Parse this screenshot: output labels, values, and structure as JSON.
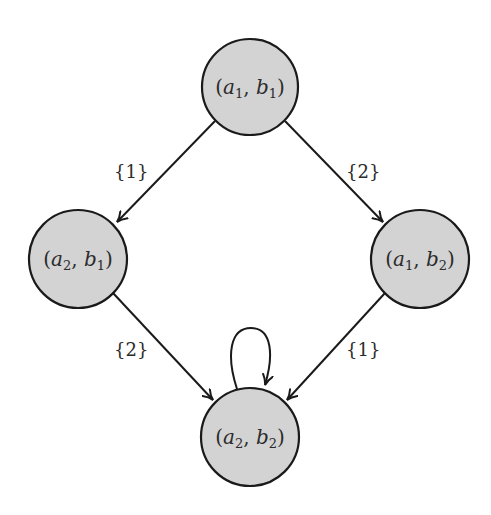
{
  "diagram": {
    "nodes": [
      {
        "id": "a1b1",
        "a": "a",
        "a_sub": "1",
        "b": "b",
        "b_sub": "1",
        "cx": 250,
        "cy": 87,
        "r": 48
      },
      {
        "id": "a2b1",
        "a": "a",
        "a_sub": "2",
        "b": "b",
        "b_sub": "1",
        "cx": 78,
        "cy": 259,
        "r": 49
      },
      {
        "id": "a1b2",
        "a": "a",
        "a_sub": "1",
        "b": "b",
        "b_sub": "2",
        "cx": 420,
        "cy": 259,
        "r": 49
      },
      {
        "id": "a2b2",
        "a": "a",
        "a_sub": "2",
        "b": "b",
        "b_sub": "2",
        "cx": 250,
        "cy": 437,
        "r": 49
      }
    ],
    "edges": [
      {
        "from": "a1b1",
        "to": "a2b1",
        "label": "{1}"
      },
      {
        "from": "a1b1",
        "to": "a1b2",
        "label": "{2}"
      },
      {
        "from": "a2b1",
        "to": "a2b2",
        "label": "{2}"
      },
      {
        "from": "a1b2",
        "to": "a2b2",
        "label": "{1}"
      },
      {
        "from": "a2b2",
        "to": "a2b2",
        "label": ""
      }
    ],
    "colors": {
      "node_fill": "#d3d3d3",
      "stroke": "#1a1a1a",
      "text": "#2b2b2b"
    }
  }
}
